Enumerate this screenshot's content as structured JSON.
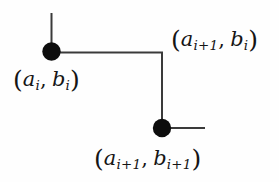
{
  "figure": {
    "name": "staircase-step-diagram",
    "background_color": "#fefefe",
    "stroke_color": "#3a3a3a",
    "node_color": "#0d0d0d",
    "text_color": "#151515"
  },
  "labels": {
    "top_right": {
      "open_paren": "(",
      "a_var": "a",
      "a_sub": "i+1",
      "comma": ",",
      "b_var": "b",
      "b_sub": "i",
      "close_paren": ")",
      "plain": "(a_{i+1}, b_i)"
    },
    "left": {
      "open_paren": "(",
      "a_var": "a",
      "a_sub": "i",
      "comma": ",",
      "b_var": "b",
      "b_sub": "i",
      "close_paren": ")",
      "plain": "(a_i, b_i)"
    },
    "bottom": {
      "open_paren": "(",
      "a_var": "a",
      "a_sub": "i+1",
      "comma": ",",
      "b_var": "b",
      "b_sub": "i+1",
      "close_paren": ")",
      "plain": "(a_{i+1}, b_{i+1})"
    }
  },
  "geometry": {
    "nodes": [
      {
        "id": "node-upper-left",
        "cx": 51.5,
        "cy": 51.5,
        "r": 9.2
      },
      {
        "id": "node-lower-right",
        "cx": 162,
        "cy": 128,
        "r": 9.2
      }
    ],
    "segments": [
      {
        "id": "segment-upper-vertical-tail",
        "x1": 51.5,
        "y1": 13,
        "x2": 51.5,
        "y2": 51.5
      },
      {
        "id": "segment-horizontal-tread",
        "x1": 51.5,
        "y1": 52.5,
        "x2": 162,
        "y2": 52.5
      },
      {
        "id": "segment-vertical-riser",
        "x1": 162,
        "y1": 52.5,
        "x2": 162,
        "y2": 128
      },
      {
        "id": "segment-lower-horizontal-tail",
        "x1": 162,
        "y1": 128,
        "x2": 205,
        "y2": 128
      }
    ],
    "stroke_width": 2
  }
}
